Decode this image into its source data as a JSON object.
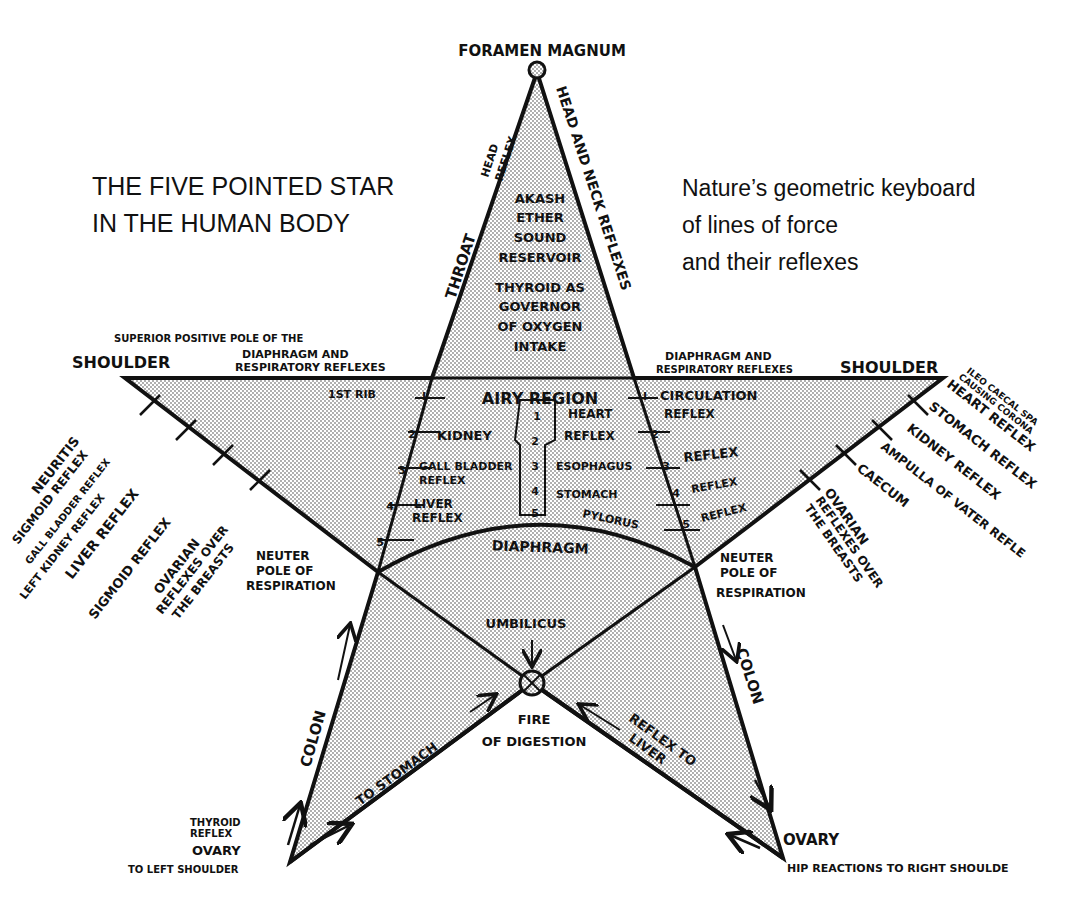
{
  "title": {
    "lines": [
      "THE FIVE POINTED STAR",
      "IN THE HUMAN BODY"
    ]
  },
  "subtitle": {
    "lines": [
      "Nature’s geometric keyboard",
      "of lines of force",
      "and their reflexes"
    ]
  },
  "apex": {
    "label": "FORAMEN MAGNUM",
    "left_edge_label": "THROAT",
    "left_edge_small": [
      "HEAD",
      "REFLEX"
    ],
    "right_edge_label": "HEAD AND NECK REFLEXES"
  },
  "top_triangle": {
    "lines_1": [
      "AKASH",
      "ETHER",
      "SOUND",
      "RESERVOIR"
    ],
    "lines_2": [
      "THYROID AS",
      "GOVERNOR",
      "OF OXYGEN",
      "INTAKE"
    ]
  },
  "left_shoulder": {
    "label": "SHOULDER",
    "note_lines": [
      "SUPERIOR POSITIVE POLE OF THE",
      "DIAPHRAGM AND",
      "RESPIRATORY REFLEXES"
    ],
    "first_rib": "1ST RIB"
  },
  "right_shoulder": {
    "label": "SHOULDER",
    "note_lines": [
      "DIAPHRAGM AND",
      "RESPIRATORY REFLEXES"
    ]
  },
  "center_region": {
    "airy": "AIRY REGION",
    "left_items": [
      "KIDNEY",
      "GALL BLADDER",
      "REFLEX",
      "LIVER",
      "REFLEX"
    ],
    "right_items": [
      "HEART",
      "REFLEX",
      "ESOPHAGUS",
      "STOMACH",
      "PYLORUS"
    ],
    "spine_numbers": [
      "1",
      "2",
      "3",
      "4",
      "5"
    ],
    "rib_numbers_left": [
      "I",
      "2",
      "3",
      "4",
      "5"
    ],
    "rib_numbers_right": [
      "I",
      "2",
      "3",
      "4",
      "5"
    ],
    "diaphragm": "DIAPHRAGM"
  },
  "right_arm_inner": {
    "items": [
      "CIRCULATION",
      "REFLEX",
      "REFLEX",
      "REFLEX",
      "REFLEX"
    ]
  },
  "left_arm_outer": {
    "items": [
      "NEURITIS",
      "SIGMOID REFLEX",
      "GALL BLADDER REFLEX",
      "LEFT KIDNEY REFLEX",
      "LIVER REFLEX",
      "SIGMOID REFLEX",
      "OVARIAN",
      "REFLEXES OVER",
      "THE BREASTS"
    ]
  },
  "right_arm_outer": {
    "items": [
      "ILEO CAECAL SPA",
      "CAUSING CORONA",
      "HEART REFLEX",
      "STOMACH REFLEX",
      "KIDNEY REFLEX",
      "AMPULLA OF VATER REFLE",
      "CAECUM",
      "OVARIAN",
      "REFLEXES OVER",
      "THE BREASTS"
    ]
  },
  "neuter_left": {
    "lines": [
      "NEUTER",
      "POLE OF",
      "RESPIRATION"
    ]
  },
  "neuter_right": {
    "lines": [
      "NEUTER",
      "POLE OF",
      "RESPIRATION"
    ]
  },
  "lower": {
    "umbilicus": "UMBILICUS",
    "fire_lines": [
      "FIRE",
      "OF DIGESTION"
    ],
    "to_stomach": "TO STOMACH",
    "reflex_to_liver": [
      "REFLEX TO",
      "LIVER"
    ],
    "colon_left": "COLON",
    "colon_right": "COLON"
  },
  "left_foot": {
    "thyroid_lines": [
      "THYROID",
      "REFLEX"
    ],
    "ovary": "OVARY",
    "to_shoulder": "TO LEFT SHOULDER"
  },
  "right_foot": {
    "ovary": "OVARY",
    "hip": "HIP REACTIONS TO RIGHT SHOULDE"
  },
  "colors": {
    "ink": "#111111",
    "paper": "#ffffff",
    "stipple": "#9a9a9a"
  }
}
